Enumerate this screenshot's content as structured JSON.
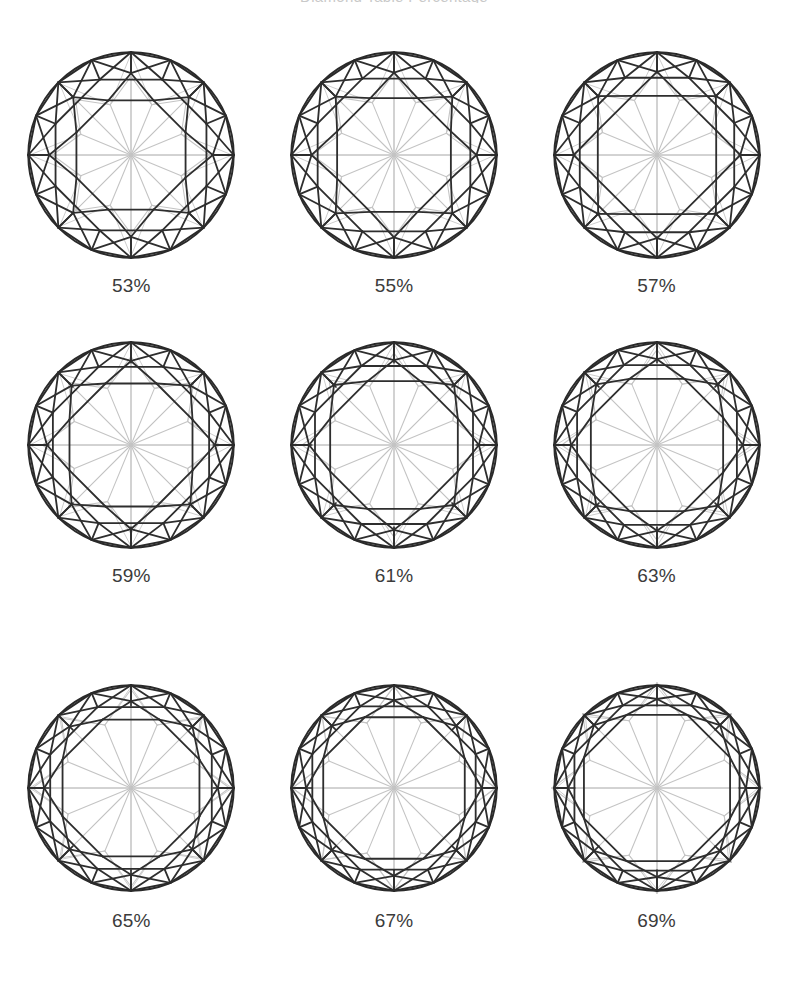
{
  "figure": {
    "title": "Diamond Table Percentage",
    "background_color": "#ffffff",
    "width": 788,
    "height": 1005
  },
  "style": {
    "crown_line_color": "#2e2e2e",
    "girdle_line_color": "#2a2a2a",
    "pavilion_line_color": "#c4c4c4",
    "label_color": "#3b3b3b",
    "crown_stroke_width": 1.7,
    "girdle_stroke_width": 1.8,
    "pavilion_stroke_width": 1.0
  },
  "chart_data": {
    "type": "diagram-grid",
    "title": "Diamond Table Percentage",
    "xlabel": "",
    "ylabel": "",
    "rows": 3,
    "columns": 3,
    "unit": "%",
    "categories": [
      "53%",
      "55%",
      "57%",
      "59%",
      "61%",
      "63%",
      "65%",
      "67%",
      "69%"
    ],
    "values": [
      53,
      55,
      57,
      59,
      61,
      63,
      65,
      67,
      69
    ],
    "series": [
      {
        "name": "table_percentage",
        "values": [
          53,
          55,
          57,
          59,
          61,
          63,
          65,
          67,
          69
        ]
      }
    ],
    "legend": [],
    "grid": false
  },
  "cells": [
    {
      "id": "cell-53",
      "label": "53%",
      "table_pct": 53,
      "row": 1,
      "col": 1
    },
    {
      "id": "cell-55",
      "label": "55%",
      "table_pct": 55,
      "row": 1,
      "col": 2
    },
    {
      "id": "cell-57",
      "label": "57%",
      "table_pct": 57,
      "row": 1,
      "col": 3
    },
    {
      "id": "cell-59",
      "label": "59%",
      "table_pct": 59,
      "row": 2,
      "col": 1
    },
    {
      "id": "cell-61",
      "label": "61%",
      "table_pct": 61,
      "row": 2,
      "col": 2
    },
    {
      "id": "cell-63",
      "label": "63%",
      "table_pct": 63,
      "row": 2,
      "col": 3
    },
    {
      "id": "cell-65",
      "label": "65%",
      "table_pct": 65,
      "row": 3,
      "col": 1
    },
    {
      "id": "cell-67",
      "label": "67%",
      "table_pct": 67,
      "row": 3,
      "col": 2
    },
    {
      "id": "cell-69",
      "label": "69%",
      "table_pct": 69,
      "row": 3,
      "col": 3
    }
  ]
}
